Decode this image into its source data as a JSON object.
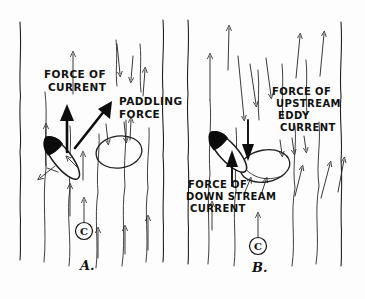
{
  "figure": {
    "background_color": "#fdfdfd",
    "ink_color": "#111111",
    "style": "hand-drawn pen sketch"
  },
  "panels": [
    {
      "id": "A",
      "caption": "A.",
      "description": "Kayak crossing the eddy line using paddling force against the main current",
      "labels": [
        {
          "name": "force-of-current",
          "lines": [
            "FORCE OF",
            "CURRENT"
          ],
          "x": 44,
          "y": 76
        },
        {
          "name": "paddling-force",
          "lines": [
            "PADDLING",
            "FORCE"
          ],
          "x": 119,
          "y": 103
        }
      ],
      "current_marker": {
        "symbol": "C",
        "meaning": "current direction",
        "x": 84,
        "y": 231
      },
      "boat": {
        "name": "kayak",
        "bow_direction": "upper-right",
        "tilt_deg": -38
      },
      "eddy": {
        "name": "eddy-pool",
        "shape": "oval"
      }
    },
    {
      "id": "B",
      "caption": "B.",
      "description": "Kayak held on the eddy line between upstream eddy current and downstream current",
      "labels": [
        {
          "name": "force-of-upstream-eddy-current",
          "lines": [
            "FORCE OF",
            "UPSTREAM",
            "EDDY",
            "CURRENT"
          ],
          "x": 272,
          "y": 93
        },
        {
          "name": "force-of-down-stream-current",
          "lines": [
            "FORCE OF",
            "DOWN STREAM",
            "CURRENT"
          ],
          "x": 188,
          "y": 186
        }
      ],
      "current_marker": {
        "symbol": "C",
        "meaning": "current direction",
        "x": 258,
        "y": 246
      },
      "boat": {
        "name": "kayak",
        "bow_direction": "upper-right",
        "tilt_deg": -42
      },
      "eddy": {
        "name": "eddy-pool",
        "shape": "oval"
      }
    }
  ],
  "legend": {
    "c_symbol": "C",
    "c_symbol_meaning": "current"
  }
}
